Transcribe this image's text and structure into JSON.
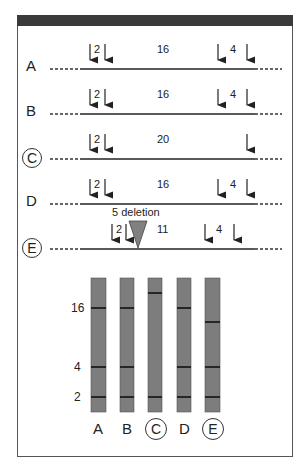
{
  "diagram": {
    "rows": [
      {
        "label": "A",
        "circled": false,
        "fragments": {
          "left": "2",
          "middle": "16",
          "right": "4"
        }
      },
      {
        "label": "B",
        "circled": false,
        "fragments": {
          "left": "2",
          "middle": "16",
          "right": "4"
        }
      },
      {
        "label": "C",
        "circled": true,
        "fragments": {
          "left": "2",
          "middle": "20",
          "right": ""
        }
      },
      {
        "label": "D",
        "circled": false,
        "fragments": {
          "left": "2",
          "middle": "16",
          "right": "4"
        }
      },
      {
        "label": "E",
        "circled": true,
        "fragments": {
          "left": "2",
          "middle": "11",
          "right": "4"
        },
        "annotation": "5 deletion"
      }
    ],
    "gel": {
      "size_markers": [
        "16",
        "4",
        "2"
      ],
      "lanes": [
        {
          "label": "A",
          "circled": false,
          "bands": [
            16,
            4,
            2
          ]
        },
        {
          "label": "B",
          "circled": false,
          "bands": [
            16,
            4,
            2
          ]
        },
        {
          "label": "C",
          "circled": true,
          "bands": [
            20,
            2
          ]
        },
        {
          "label": "D",
          "circled": false,
          "bands": [
            16,
            4,
            2
          ]
        },
        {
          "label": "E",
          "circled": true,
          "bands": [
            11,
            4,
            2
          ]
        }
      ]
    },
    "colors": {
      "frame": "#555555",
      "header": "#3a3a3a",
      "lane": "#7d7d7d",
      "band": "#111111",
      "triangle": "#808080"
    }
  }
}
